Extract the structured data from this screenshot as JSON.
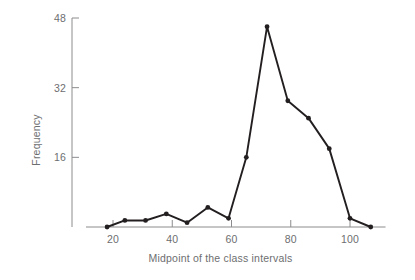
{
  "chart_data": {
    "type": "line",
    "title": "",
    "subtitle": "",
    "xlabel": "Midpoint of the class intervals",
    "ylabel": "Frequency",
    "x": [
      18,
      24,
      31,
      38,
      45,
      52,
      59,
      65,
      72,
      79,
      86,
      93,
      100,
      107
    ],
    "values": [
      0,
      1.5,
      1.5,
      3,
      1,
      4.5,
      2,
      16,
      46,
      29,
      25,
      18,
      2,
      0
    ],
    "series": [
      {
        "name": "Frequency",
        "values": [
          0,
          1.5,
          1.5,
          3,
          1,
          4.5,
          2,
          16,
          46,
          29,
          25,
          18,
          2,
          0
        ]
      }
    ],
    "xlim": [
      14,
      112
    ],
    "ylim": [
      0,
      48
    ],
    "xticks": [
      20,
      40,
      60,
      80,
      100
    ],
    "yticks": [
      16,
      32,
      48
    ],
    "xtick_labels": [
      "20",
      "40",
      "60",
      "80",
      "100"
    ],
    "ytick_labels": [
      "16",
      "32",
      "48"
    ],
    "grid": false,
    "legend": null,
    "markers": "filled-circle",
    "line_color": "#231f20",
    "axis_color": "#8c8c8e",
    "marker_color": "#231f20",
    "background": "#ffffff"
  }
}
